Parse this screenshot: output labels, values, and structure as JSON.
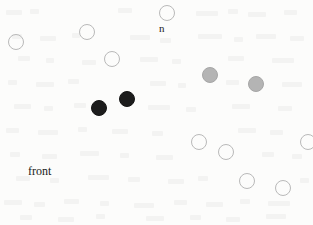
{
  "figure": {
    "width": 313,
    "height": 225,
    "background_color": "#fcfcfb"
  },
  "labels": [
    {
      "name": "label-n",
      "text": "n",
      "x": 159,
      "y": 23,
      "font_size": 11,
      "color": "#1a1a1a"
    },
    {
      "name": "label-front",
      "text": "front",
      "x": 28,
      "y": 165,
      "font_size": 12,
      "color": "#1a1a1a"
    }
  ],
  "legend_colors": {
    "open_marker_stroke": "#b9b9b9",
    "black_marker_fill": "#1c1c1c",
    "gray_marker_fill": "#b4b4b4"
  },
  "chart_data": {
    "type": "scatter",
    "title": "",
    "xlabel": "",
    "ylabel": "",
    "xlim": [
      0,
      313
    ],
    "ylim": [
      0,
      225
    ],
    "grid": false,
    "legend_position": "none",
    "annotations": [
      {
        "text": "n",
        "x": 159,
        "y": 23
      },
      {
        "text": "front",
        "x": 28,
        "y": 165
      }
    ],
    "series": [
      {
        "name": "open",
        "fill": "none",
        "stroke": "#b9b9b9",
        "radius": 8,
        "points": [
          {
            "x": 16,
            "y": 42
          },
          {
            "x": 87,
            "y": 32
          },
          {
            "x": 167,
            "y": 13
          },
          {
            "x": 112,
            "y": 59
          },
          {
            "x": 199,
            "y": 142
          },
          {
            "x": 226,
            "y": 152
          },
          {
            "x": 308,
            "y": 142
          },
          {
            "x": 247,
            "y": 181
          },
          {
            "x": 283,
            "y": 188
          }
        ]
      },
      {
        "name": "black",
        "fill": "#1c1c1c",
        "stroke": "#151515",
        "radius": 8,
        "points": [
          {
            "x": 99,
            "y": 108
          },
          {
            "x": 127,
            "y": 99
          }
        ]
      },
      {
        "name": "gray",
        "fill": "#b4b4b4",
        "stroke": "#a6a6a6",
        "radius": 8,
        "points": [
          {
            "x": 210,
            "y": 75
          },
          {
            "x": 256,
            "y": 84
          }
        ]
      }
    ]
  }
}
